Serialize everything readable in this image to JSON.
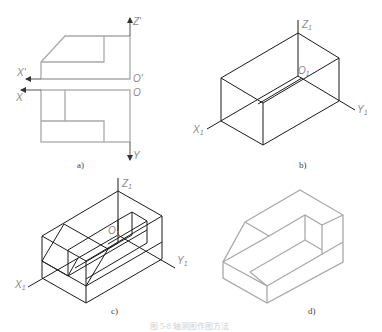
{
  "figure": {
    "caption": "图 5-8  轴测图作图方法",
    "colors": {
      "orthographic_line": "#a9a9a9",
      "construction_line": "#1a1a1a",
      "label": "#8a8a8a"
    },
    "panels": [
      {
        "id": "a",
        "label": "a)",
        "description": "Orthographic views (front and top) of an L-shaped block with chamfer",
        "axes": {
          "z": "Z'",
          "x_front": "X'",
          "origin_front": "O'",
          "x_top": "X",
          "origin_top": "O",
          "y": "Y"
        }
      },
      {
        "id": "b",
        "label": "b)",
        "description": "Isometric bounding box with axes",
        "axes": {
          "z": "Z",
          "z_sub": "1",
          "x": "X",
          "x_sub": "1",
          "y": "Y",
          "y_sub": "1",
          "origin": "O",
          "origin_sub": "1"
        }
      },
      {
        "id": "c",
        "label": "c)",
        "description": "Cutting the bounding box: chamfer and slot construction",
        "axes": {
          "z": "Z",
          "z_sub": "1",
          "x": "X",
          "x_sub": "1",
          "y": "Y",
          "y_sub": "1",
          "origin": "O",
          "origin_sub": "1"
        }
      },
      {
        "id": "d",
        "label": "d)",
        "description": "Finished isometric drawing of the part"
      }
    ]
  }
}
